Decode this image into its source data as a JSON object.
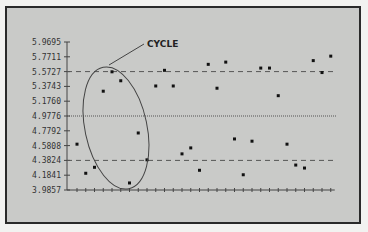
{
  "chart_data": {
    "type": "scatter",
    "title": "",
    "xlabel": "",
    "ylabel": "",
    "yticks": [
      "5.9695",
      "5.7711",
      "5.5727",
      "5.3743",
      "5.1760",
      "4.9776",
      "4.7792",
      "4.5808",
      "4.3824",
      "4.1841",
      "3.9857"
    ],
    "ylim": [
      3.9857,
      5.9695
    ],
    "x": [
      1,
      2,
      3,
      4,
      5,
      6,
      7,
      8,
      9,
      10,
      11,
      12,
      13,
      14,
      15,
      16,
      17,
      18,
      19,
      20,
      21,
      22,
      23,
      24,
      25,
      26,
      27,
      28,
      29,
      30
    ],
    "values": [
      4.6,
      4.21,
      4.29,
      5.31,
      5.57,
      5.45,
      4.08,
      4.75,
      4.39,
      5.38,
      5.59,
      5.38,
      4.47,
      4.55,
      4.25,
      5.67,
      5.35,
      5.7,
      4.67,
      4.19,
      4.64,
      5.62,
      5.62,
      5.25,
      4.6,
      4.32,
      4.28,
      5.72,
      5.56,
      5.78
    ],
    "reference_lines": [
      {
        "name": "upper-control-limit",
        "value": 5.5727,
        "style": "dashed"
      },
      {
        "name": "center-line",
        "value": 4.9776,
        "style": "dotted"
      },
      {
        "name": "lower-control-limit",
        "value": 4.3824,
        "style": "dashed"
      }
    ],
    "annotations": [
      {
        "text": "CYCLE",
        "target": "points 4-9 (ellipse)"
      }
    ],
    "grid": false,
    "legend": null
  },
  "annotation": {
    "label": "CYCLE"
  }
}
